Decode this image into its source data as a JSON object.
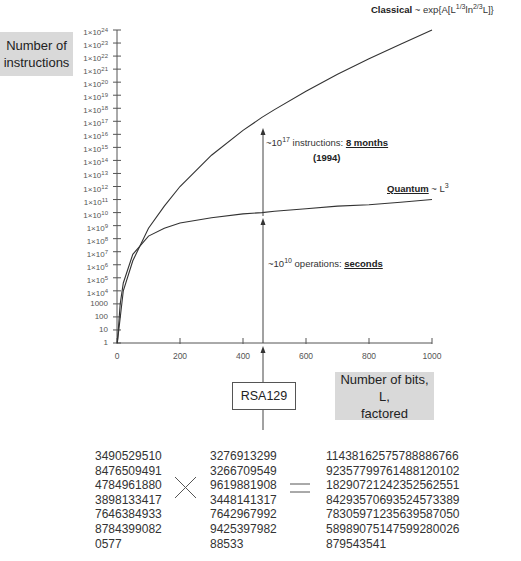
{
  "chart_data": {
    "type": "line",
    "title": "",
    "ylabel": "Number of instructions",
    "xlabel": "Number of bits, L, factored",
    "x_ticks": [
      "0",
      "200",
      "400",
      "600",
      "800",
      "1000"
    ],
    "xlim": [
      0,
      1000
    ],
    "y_scale": "log",
    "ylim": [
      1,
      1e+24
    ],
    "y_ticks": [
      "1",
      "10",
      "100",
      "1000",
      "1×10^4",
      "1×10^5",
      "1×10^6",
      "1×10^7",
      "1×10^8",
      "1×10^9",
      "1×10^10",
      "1×10^11",
      "1×10^12",
      "1×10^13",
      "1×10^14",
      "1×10^15",
      "1×10^16",
      "1×10^17",
      "1×10^18",
      "1×10^19",
      "1×10^20",
      "1×10^21",
      "1×10^22",
      "1×10^23",
      "1×10^24"
    ],
    "grid": false,
    "series": [
      {
        "name": "Classical ~ exp{A[L^(1/3) ln^(2/3) L]}",
        "x": [
          1,
          20,
          50,
          100,
          150,
          200,
          300,
          400,
          460,
          500,
          600,
          700,
          800,
          900,
          1000
        ],
        "y_log10": [
          0,
          4.0,
          6.3,
          8.8,
          10.5,
          12.0,
          14.4,
          16.3,
          17.3,
          17.9,
          19.3,
          20.6,
          21.8,
          22.9,
          24.0
        ]
      },
      {
        "name": "Quantum ~ L^3",
        "x": [
          1,
          10,
          20,
          50,
          100,
          150,
          200,
          300,
          400,
          460,
          500,
          600,
          700,
          800,
          900,
          1000
        ],
        "y_log10": [
          0,
          3.0,
          4.6,
          6.8,
          8.2,
          8.8,
          9.2,
          9.6,
          9.9,
          10.0,
          10.1,
          10.3,
          10.5,
          10.6,
          10.8,
          11.0
        ]
      }
    ],
    "annotations": [
      {
        "x": 460,
        "text": "~10^17 instructions: 8 months (1994)"
      },
      {
        "x": 460,
        "text": "~10^10 operations: seconds"
      },
      {
        "x": 460,
        "text": "RSA129"
      }
    ]
  },
  "axis": {
    "ylabel_line1": "Number of",
    "ylabel_line2": "instructions",
    "xlabel_line1": "Number of bits, L,",
    "xlabel_line2": "factored",
    "y_ticks": [
      {
        "base": "1",
        "exp": ""
      },
      {
        "base": "10",
        "exp": ""
      },
      {
        "base": "100",
        "exp": ""
      },
      {
        "base": "1000",
        "exp": ""
      },
      {
        "base": "1×10",
        "exp": "4"
      },
      {
        "base": "1×10",
        "exp": "5"
      },
      {
        "base": "1×10",
        "exp": "6"
      },
      {
        "base": "1×10",
        "exp": "7"
      },
      {
        "base": "1×10",
        "exp": "8"
      },
      {
        "base": "1×10",
        "exp": "9"
      },
      {
        "base": "1×10",
        "exp": "10"
      },
      {
        "base": "1×10",
        "exp": "11"
      },
      {
        "base": "1×10",
        "exp": "12"
      },
      {
        "base": "1×10",
        "exp": "13"
      },
      {
        "base": "1×10",
        "exp": "14"
      },
      {
        "base": "1×10",
        "exp": "15"
      },
      {
        "base": "1×10",
        "exp": "16"
      },
      {
        "base": "1×10",
        "exp": "17"
      },
      {
        "base": "1×10",
        "exp": "18"
      },
      {
        "base": "1×10",
        "exp": "19"
      },
      {
        "base": "1×10",
        "exp": "20"
      },
      {
        "base": "1×10",
        "exp": "21"
      },
      {
        "base": "1×10",
        "exp": "22"
      },
      {
        "base": "1×10",
        "exp": "23"
      },
      {
        "base": "1×10",
        "exp": "24"
      }
    ],
    "x_ticks": [
      "0",
      "200",
      "400",
      "600",
      "800",
      "1000"
    ]
  },
  "labels": {
    "classical_name": "Classical",
    "classical_formula_a": " ~ exp{A[L",
    "classical_sup1": "1/3",
    "classical_formula_b": "ln",
    "classical_sup2": "2/3",
    "classical_formula_c": "L]}",
    "quantum_name": "Quantum",
    "quantum_formula": " ~ L",
    "quantum_sup": "3",
    "anno1_prefix": "~10",
    "anno1_sup": "17",
    "anno1_mid": " instructions: ",
    "anno1_bold": "8 months",
    "anno1_year": "(1994)",
    "anno2_prefix": "~10",
    "anno2_sup": "10",
    "anno2_mid": " operations: ",
    "anno2_bold": "seconds",
    "rsa": "RSA129"
  },
  "factoring": {
    "factor1": [
      "3490529510",
      "8476509491",
      "4784961880",
      "3898133417",
      "7646384933",
      "8784399082",
      "0577"
    ],
    "factor2": [
      "3276913299",
      "3266709549",
      "9619881908",
      "3448141317",
      "7642967992",
      "9425397982",
      "88533"
    ],
    "product": [
      "1143816257578888676 6",
      "92357799761488120102",
      "18290721242352562551",
      "84293570693524573389",
      "78305971235639587050",
      "58989075147599280026",
      "879543541"
    ],
    "times_symbol": "×",
    "equals_symbol": "="
  }
}
